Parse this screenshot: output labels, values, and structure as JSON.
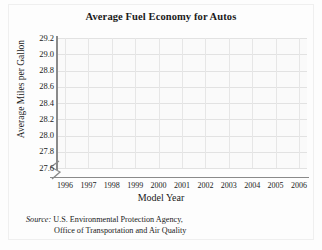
{
  "chart_data": {
    "type": "line",
    "title": "Average Fuel Economy for Autos",
    "xlabel": "Model Year",
    "ylabel": "Average Miles per Gallon",
    "categories": [
      "1996",
      "1997",
      "1998",
      "1999",
      "2000",
      "2001",
      "2002",
      "2003",
      "2004",
      "2005",
      "2006"
    ],
    "values": [
      28.3,
      28.4,
      28.5,
      28.2,
      28.1,
      28.5,
      28.8,
      29.0,
      28.7,
      28.7,
      28.9
    ],
    "ylim": [
      27.6,
      29.2
    ],
    "ytick_labels": [
      "29.2",
      "29.0",
      "28.8",
      "28.6",
      "28.4",
      "28.2",
      "28.0",
      "27.8",
      "27.6"
    ],
    "ytick_values": [
      29.2,
      29.0,
      28.8,
      28.6,
      28.4,
      28.2,
      28.0,
      27.8,
      27.6
    ],
    "grid": true,
    "legend": "none",
    "axis_break": "y-axis break below 27.6",
    "series_color": "#6b6b6b",
    "marker": "circle"
  },
  "source": {
    "label": "Source:",
    "line1": "U.S. Environmental Protection Agency,",
    "line2": "Office of Transportation and Air Quality"
  }
}
